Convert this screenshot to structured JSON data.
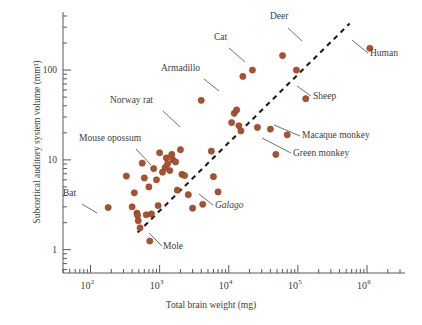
{
  "chart_data": {
    "type": "scatter",
    "title": "",
    "xlabel": "Total brain weight (mg)",
    "ylabel": "Subcortical auditory system volume (mm³)",
    "x_scale": "log",
    "y_scale": "log",
    "xlim": [
      40,
      3000000
    ],
    "ylim": [
      0.55,
      400
    ],
    "x_ticks": [
      100,
      1000,
      10000,
      100000,
      1000000
    ],
    "x_tick_labels": [
      "10",
      "10",
      "10",
      "10",
      "10"
    ],
    "x_tick_exponents": [
      "2",
      "3",
      "4",
      "5",
      "6"
    ],
    "y_ticks": [
      1,
      10,
      100
    ],
    "y_tick_labels": [
      "1",
      "10",
      "100"
    ],
    "grid": false,
    "legend": "none",
    "point_color": "#a9522f",
    "point_edge_color": "#8d3f20",
    "point_radius": 3.1,
    "trendline": {
      "style": "dashed",
      "color": "#1c1c1c",
      "x_start": 480,
      "y_start": 1.55,
      "x_end": 560000,
      "y_end": 330
    },
    "points": [
      {
        "x": 180,
        "y": 2.95
      },
      {
        "x": 330,
        "y": 6.6
      },
      {
        "x": 400,
        "y": 3.0
      },
      {
        "x": 430,
        "y": 4.3
      },
      {
        "x": 470,
        "y": 2.55
      },
      {
        "x": 480,
        "y": 2.4
      },
      {
        "x": 490,
        "y": 2.1
      },
      {
        "x": 520,
        "y": 1.75
      },
      {
        "x": 560,
        "y": 9.2
      },
      {
        "x": 600,
        "y": 6.3
      },
      {
        "x": 640,
        "y": 2.45
      },
      {
        "x": 700,
        "y": 5.0
      },
      {
        "x": 720,
        "y": 1.25
      },
      {
        "x": 760,
        "y": 2.5
      },
      {
        "x": 820,
        "y": 8.0
      },
      {
        "x": 900,
        "y": 6.0
      },
      {
        "x": 950,
        "y": 3.1
      },
      {
        "x": 1000,
        "y": 12.0
      },
      {
        "x": 1100,
        "y": 7.3
      },
      {
        "x": 1200,
        "y": 8.2
      },
      {
        "x": 1250,
        "y": 10.5
      },
      {
        "x": 1300,
        "y": 9.0
      },
      {
        "x": 1400,
        "y": 7.6
      },
      {
        "x": 1500,
        "y": 11.5
      },
      {
        "x": 1550,
        "y": 10.0
      },
      {
        "x": 1700,
        "y": 9.5
      },
      {
        "x": 1800,
        "y": 4.6
      },
      {
        "x": 2000,
        "y": 13.0
      },
      {
        "x": 2100,
        "y": 6.9
      },
      {
        "x": 2300,
        "y": 6.7
      },
      {
        "x": 2600,
        "y": 4.1
      },
      {
        "x": 3000,
        "y": 2.9
      },
      {
        "x": 4000,
        "y": 46.0
      },
      {
        "x": 4200,
        "y": 3.2
      },
      {
        "x": 5600,
        "y": 12.5
      },
      {
        "x": 6000,
        "y": 6.5
      },
      {
        "x": 7000,
        "y": 4.4
      },
      {
        "x": 11000,
        "y": 26.0
      },
      {
        "x": 12000,
        "y": 33.0
      },
      {
        "x": 13000,
        "y": 36.0
      },
      {
        "x": 14000,
        "y": 24.0
      },
      {
        "x": 15000,
        "y": 21.0
      },
      {
        "x": 16000,
        "y": 85.0
      },
      {
        "x": 22000,
        "y": 100.0
      },
      {
        "x": 26000,
        "y": 23.0
      },
      {
        "x": 40000,
        "y": 22.0
      },
      {
        "x": 48000,
        "y": 11.5
      },
      {
        "x": 60000,
        "y": 145.0
      },
      {
        "x": 70000,
        "y": 19.0
      },
      {
        "x": 95000,
        "y": 100.0
      },
      {
        "x": 130000,
        "y": 48.0
      },
      {
        "x": 1100000,
        "y": 175.0
      }
    ],
    "annotations": [
      {
        "label": "Bat",
        "italic": false,
        "text_x": 63,
        "text_y": 196,
        "line_from": [
          82,
          204
        ],
        "line_to": [
          97,
          213
        ]
      },
      {
        "label": "Mouse opossum",
        "italic": false,
        "text_x": 79,
        "text_y": 141,
        "line_from": [
          136,
          149
        ],
        "line_to": [
          151,
          165
        ]
      },
      {
        "label": "Norway rat",
        "italic": false,
        "text_x": 110,
        "text_y": 103,
        "line_from": [
          163,
          111
        ],
        "line_to": [
          180,
          127
        ]
      },
      {
        "label": "Armadillo",
        "italic": false,
        "text_x": 161,
        "text_y": 71,
        "line_from": [
          204,
          79
        ],
        "line_to": [
          219,
          91
        ]
      },
      {
        "label": "Cat",
        "italic": false,
        "text_x": 214,
        "text_y": 40,
        "line_from": [
          229,
          48
        ],
        "line_to": [
          245,
          62
        ]
      },
      {
        "label": "Deer",
        "italic": false,
        "text_x": 270,
        "text_y": 19,
        "line_from": [
          288,
          28
        ],
        "line_to": [
          302,
          41
        ]
      },
      {
        "label": "Human",
        "italic": false,
        "text_x": 370,
        "text_y": 56,
        "line_from": [
          368,
          53
        ],
        "line_to": [
          352,
          40
        ]
      },
      {
        "label": "Sheep",
        "italic": false,
        "text_x": 313,
        "text_y": 99,
        "line_from": [
          311,
          96
        ],
        "line_to": [
          297,
          86
        ]
      },
      {
        "label": "Macaque monkey",
        "italic": false,
        "text_x": 302,
        "text_y": 138,
        "line_from": [
          300,
          136
        ],
        "line_to": [
          274,
          125
        ]
      },
      {
        "label": "Green monkey",
        "italic": false,
        "text_x": 293,
        "text_y": 156,
        "line_from": [
          291,
          153
        ],
        "line_to": [
          262,
          138
        ]
      },
      {
        "label": "Galago",
        "italic": true,
        "text_x": 215,
        "text_y": 208,
        "line_from": [
          213,
          205
        ],
        "line_to": [
          199,
          194
        ]
      },
      {
        "label": "Mole",
        "italic": false,
        "text_x": 163,
        "text_y": 249,
        "line_from": [
          162,
          246
        ],
        "line_to": [
          149,
          233
        ]
      }
    ]
  }
}
